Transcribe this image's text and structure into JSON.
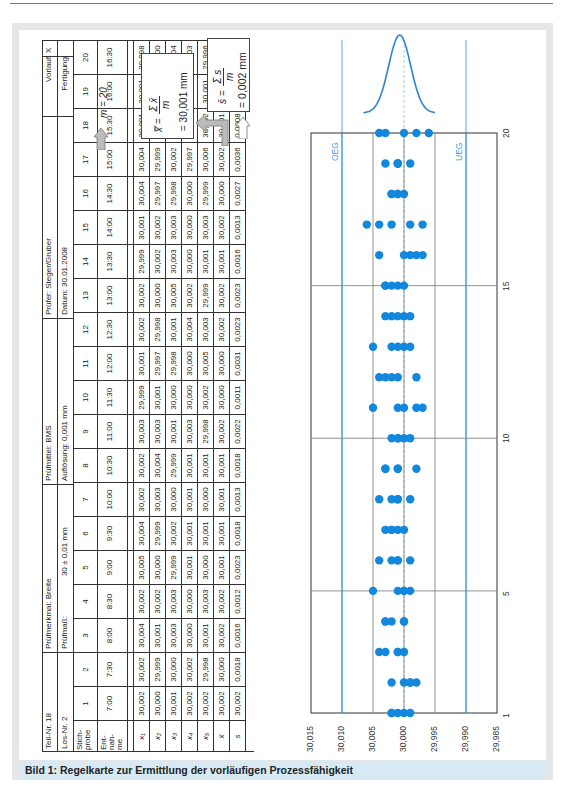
{
  "caption": "Bild 1: Regelkarte zur Ermittlung der vorläufigen Prozessfähigkeit",
  "header": {
    "teil_nr": "Teil-Nr. 18",
    "los_nr": "Los-Nr.  2",
    "pruefmerkmal": "Prüfmerkmal:  Breite",
    "pruefmass_label": "Prüfmaß:",
    "pruefmass_value": "30 ± 0,01 mm",
    "pruefmittel": "Prüfmittel:  BMS",
    "aufloesung": "Auflösung: 0,001 mm",
    "pruefer": "Prüfer:  Steger/Gruber",
    "datum": "Datum:  30.01.2008",
    "vorlauf": "Vorlauf",
    "vorlauf_mark": "X",
    "fertigung": "Fertigung"
  },
  "table": {
    "row_labels": {
      "stichprobe": "Stich-\nprobe",
      "entnahme": "Ent-\nnah-\nme",
      "x1": "x₁",
      "x2": "x₂",
      "x3": "x₃",
      "x4": "x₄",
      "x5": "x₅",
      "xbar": "x̄",
      "s": "s"
    },
    "samples": [
      {
        "n": "1",
        "time": "7:00",
        "x": [
          "30,002",
          "30,000",
          "30,001",
          "30,002",
          "30,002"
        ],
        "xbar": "30,002",
        "s": "30,002"
      },
      {
        "n": "2",
        "time": "7:30",
        "x": [
          "30,002",
          "29,999",
          "30,000",
          "30,002",
          "29,998"
        ],
        "xbar": "30,000",
        "s": "0,0018"
      },
      {
        "n": "3",
        "time": "8:00",
        "x": [
          "30,004",
          "30,001",
          "30,003",
          "30,000",
          "30,001"
        ],
        "xbar": "30,002",
        "s": "0,0016"
      },
      {
        "n": "4",
        "time": "8:30",
        "x": [
          "30,002",
          "30,002",
          "30,003",
          "30,000",
          "30,003"
        ],
        "xbar": "30,002",
        "s": "0,0012"
      },
      {
        "n": "5",
        "time": "9:00",
        "x": [
          "30,005",
          "30,000",
          "29,999",
          "30,001",
          "30,000"
        ],
        "xbar": "30,001",
        "s": "0,0023"
      },
      {
        "n": "6",
        "time": "9:30",
        "x": [
          "30,004",
          "29,999",
          "30,002",
          "30,001",
          "30,001"
        ],
        "xbar": "30,001",
        "s": "0,0018"
      },
      {
        "n": "7",
        "time": "10:00",
        "x": [
          "30,002",
          "30,003",
          "30,000",
          "30,001",
          "30,000"
        ],
        "xbar": "30,001",
        "s": "0,0013"
      },
      {
        "n": "8",
        "time": "10:30",
        "x": [
          "30,002",
          "30,004",
          "29,999",
          "30,001",
          "30,001"
        ],
        "xbar": "30,001",
        "s": "0,0018"
      },
      {
        "n": "9",
        "time": "11:00",
        "x": [
          "30,003",
          "30,003",
          "30,001",
          "30,003",
          "29,998"
        ],
        "xbar": "30,002",
        "s": "0,0022"
      },
      {
        "n": "10",
        "time": "11:30",
        "x": [
          "29,999",
          "30,001",
          "30,000",
          "30,000",
          "30,002"
        ],
        "xbar": "30,000",
        "s": "0,0011"
      },
      {
        "n": "11",
        "time": "12:00",
        "x": [
          "30,001",
          "29,997",
          "29,998",
          "30,000",
          "30,005"
        ],
        "xbar": "30,000",
        "s": "0,0031"
      },
      {
        "n": "12",
        "time": "12:30",
        "x": [
          "30,002",
          "29,998",
          "30,001",
          "30,004",
          "30,003"
        ],
        "xbar": "30,002",
        "s": "0,0023"
      },
      {
        "n": "13",
        "time": "13:00",
        "x": [
          "30,002",
          "30,000",
          "30,005",
          "30,002",
          "29,999"
        ],
        "xbar": "30,002",
        "s": "0,0023"
      },
      {
        "n": "14",
        "time": "13:30",
        "x": [
          "29,999",
          "30,002",
          "30,003",
          "30,000",
          "30,001"
        ],
        "xbar": "30,001",
        "s": "0,0016"
      },
      {
        "n": "15",
        "time": "14:00",
        "x": [
          "30,001",
          "30,002",
          "30,003",
          "30,000",
          "30,003"
        ],
        "xbar": "30,002",
        "s": "0,0013"
      },
      {
        "n": "16",
        "time": "14:30",
        "x": [
          "30,004",
          "29,997",
          "29,998",
          "30,000",
          "29,999"
        ],
        "xbar": "30,000",
        "s": "0,0027"
      },
      {
        "n": "17",
        "time": "15:00",
        "x": [
          "30,004",
          "29,999",
          "30,002",
          "29,997",
          "30,006"
        ],
        "xbar": "30,002",
        "s": "0,0036"
      },
      {
        "n": "18",
        "time": "15:30",
        "x": [
          "30,001",
          "30,001",
          "30,002",
          "30,000",
          "30,002"
        ],
        "xbar": "30,001",
        "s": "0,0008"
      },
      {
        "n": "19",
        "time": "16:00",
        "x": [
          "30,001",
          "30,003",
          "29,999",
          "30,001",
          "30,001"
        ],
        "xbar": "30,001",
        "s": "0,0014"
      },
      {
        "n": "20",
        "time": "16:30",
        "x": [
          "29,998",
          "30,000",
          "30,004",
          "30,003",
          "29,996"
        ],
        "xbar": "30,000",
        "s": "0,0033"
      }
    ]
  },
  "formulas": {
    "m": "m = 20",
    "xbarbar_lhs": "x̿ =",
    "xbarbar_num": "Σ x̄",
    "xbarbar_den": "m",
    "xbarbar_result": "= 30,001 mm",
    "sbar_lhs": "s̄ =",
    "sbar_num": "Σ s",
    "sbar_den": "m",
    "sbar_result": "= 0,002 mm"
  },
  "chart_data": {
    "type": "scatter",
    "title": "",
    "xlabel": "Stichprobe",
    "ylabel": "Messwert (mm)",
    "x_ticks": [
      "1",
      "5",
      "10",
      "15",
      "20"
    ],
    "y_ticks": [
      "30,015",
      "30,010",
      "30,005",
      "30,000",
      "29,995",
      "29,990",
      "29,985"
    ],
    "ylim": [
      29.985,
      30.015
    ],
    "xlim": [
      1,
      20
    ],
    "limit_lines": [
      {
        "name": "OEG",
        "value": 30.01,
        "color": "#1e88d0"
      },
      {
        "name": "UEG",
        "value": 29.99,
        "color": "#1e88d0"
      }
    ],
    "grid": true,
    "distribution_curve": "normal, centered at 30,001",
    "point_color": "#1188dd",
    "series": [
      {
        "sample": 1,
        "values": [
          30.002,
          30.0,
          30.001,
          30.002,
          29.999
        ]
      },
      {
        "sample": 2,
        "values": [
          30.002,
          29.999,
          30.0,
          29.998,
          29.999
        ]
      },
      {
        "sample": 3,
        "values": [
          30.004,
          30.001,
          30.003,
          30.0,
          30.001
        ]
      },
      {
        "sample": 4,
        "values": [
          30.002,
          30.003,
          30.0,
          30.003,
          30.0
        ]
      },
      {
        "sample": 5,
        "values": [
          30.005,
          30.0,
          29.999,
          30.001,
          30.0
        ]
      },
      {
        "sample": 6,
        "values": [
          30.004,
          29.999,
          30.002,
          30.001,
          30.001
        ]
      },
      {
        "sample": 7,
        "values": [
          30.003,
          30.002,
          30.001,
          30.0,
          30.002
        ]
      },
      {
        "sample": 8,
        "values": [
          30.004,
          30.002,
          30.001,
          29.999,
          30.001
        ]
      },
      {
        "sample": 9,
        "values": [
          30.003,
          30.001,
          29.998,
          30.003,
          30.001
        ]
      },
      {
        "sample": 10,
        "values": [
          30.002,
          30.001,
          30.0,
          29.999,
          30.001
        ]
      },
      {
        "sample": 11,
        "values": [
          30.005,
          30.001,
          30.0,
          29.998,
          29.997
        ]
      },
      {
        "sample": 12,
        "values": [
          30.004,
          30.003,
          30.002,
          30.001,
          29.998
        ]
      },
      {
        "sample": 13,
        "values": [
          30.005,
          30.002,
          30.001,
          30.0,
          29.999
        ]
      },
      {
        "sample": 14,
        "values": [
          30.003,
          30.002,
          30.001,
          30.0,
          29.999
        ]
      },
      {
        "sample": 15,
        "values": [
          30.003,
          30.002,
          30.001,
          30.0,
          30.003
        ]
      },
      {
        "sample": 16,
        "values": [
          30.004,
          29.999,
          29.998,
          30.0,
          29.997
        ]
      },
      {
        "sample": 17,
        "values": [
          30.006,
          30.004,
          30.002,
          29.999,
          29.997
        ]
      },
      {
        "sample": 18,
        "values": [
          30.002,
          30.001,
          30.0,
          30.002,
          30.001
        ]
      },
      {
        "sample": 19,
        "values": [
          30.003,
          30.001,
          29.999,
          30.001,
          30.001
        ]
      },
      {
        "sample": 20,
        "values": [
          30.004,
          30.003,
          30.0,
          29.998,
          29.996
        ]
      }
    ]
  }
}
